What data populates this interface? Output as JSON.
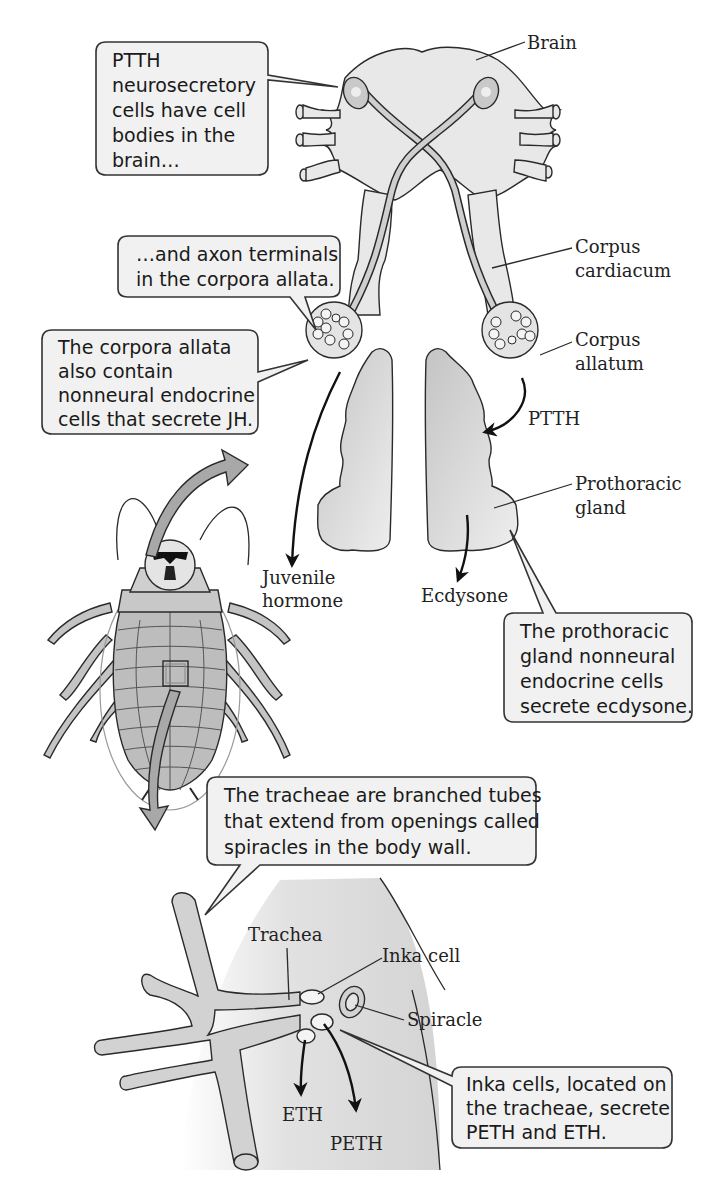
{
  "figure": {
    "colors": {
      "tissue_light": "#e6e6e6",
      "tissue_mid": "#cfcfcf",
      "gland": "#bdbdbd",
      "callout_fill": "#f1f1f1",
      "big_arrow": "#a8a8a8",
      "outline": "#2a2a2a"
    },
    "callouts": {
      "ptth_neurons": [
        "PTTH",
        "neurosecretory",
        "cells have cell",
        "bodies in the",
        "brain…"
      ],
      "axon_terminals": [
        "…and axon terminals",
        "in the corpora allata."
      ],
      "corpora_allata": [
        "The corpora allata",
        "also contain",
        "nonneural endocrine",
        "cells that secrete JH."
      ],
      "prothoracic": [
        "The prothoracic",
        "gland nonneural",
        "endocrine cells",
        "secrete ecdysone."
      ],
      "tracheae": [
        "The tracheae are branched tubes",
        "that extend from openings called",
        "spiracles in the body wall."
      ],
      "inka": [
        "Inka cells, located on",
        "the tracheae, secrete",
        "PETH and ETH."
      ]
    },
    "labels": {
      "brain": "Brain",
      "corpus_cardiacum": [
        "Corpus",
        "cardiacum"
      ],
      "corpus_allatum": [
        "Corpus",
        "allatum"
      ],
      "ptth": "PTTH",
      "prothoracic_gland": [
        "Prothoracic",
        "gland"
      ],
      "juvenile_hormone": [
        "Juvenile",
        "hormone"
      ],
      "ecdysone": "Ecdysone",
      "trachea": "Trachea",
      "inka_cell": "Inka cell",
      "spiracle": "Spiracle",
      "eth": "ETH",
      "peth": "PETH"
    }
  }
}
